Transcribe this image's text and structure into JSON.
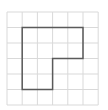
{
  "grid": {
    "columns": 6,
    "rows": 6,
    "origin_x": 7,
    "origin_y": 12,
    "cell_w": 15.2,
    "cell_h": 15.5,
    "line_color": "#d9d9d9"
  },
  "shape": {
    "name": "L-shaped polygon",
    "stroke_color": "#5a5a5a",
    "stroke_width": 1.5,
    "vertices_grid_units": [
      [
        1,
        1
      ],
      [
        5,
        1
      ],
      [
        5,
        3
      ],
      [
        3,
        3
      ],
      [
        3,
        5
      ],
      [
        1,
        5
      ]
    ]
  }
}
